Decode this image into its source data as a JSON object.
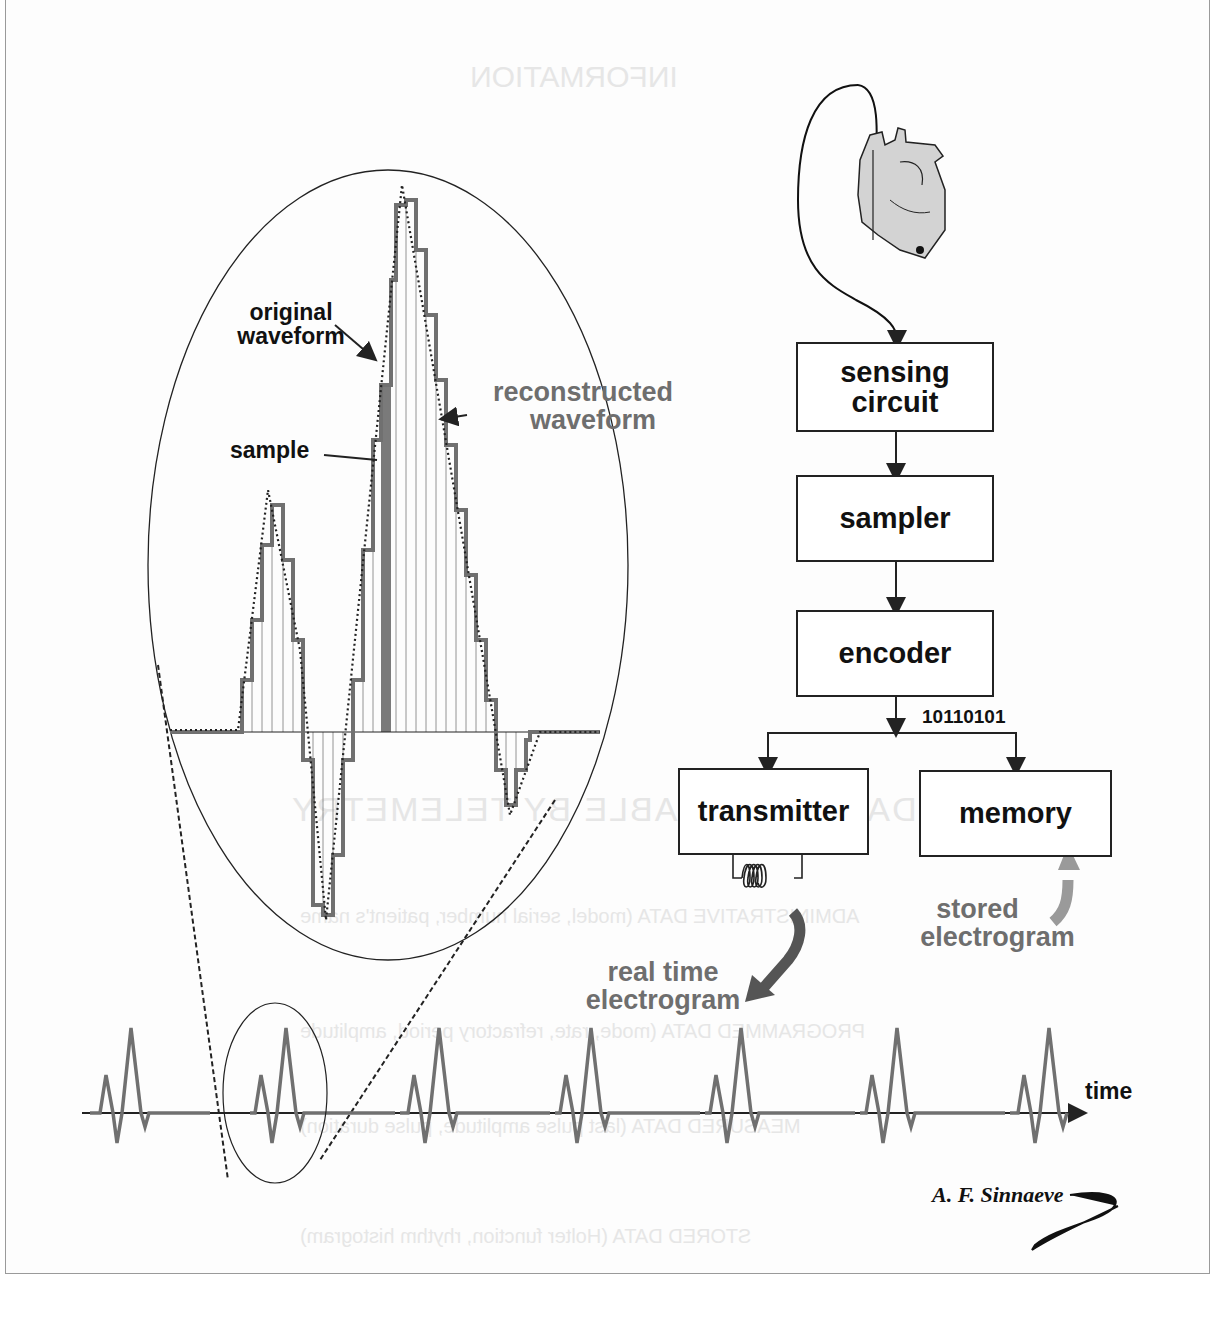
{
  "figure": {
    "author_signature": "A. F. Sinnaeve"
  },
  "zoom_view": {
    "labels": {
      "original_waveform": [
        "original",
        "waveform"
      ],
      "reconstructed_waveform": [
        "reconstructed",
        "waveform"
      ],
      "sample": "sample"
    }
  },
  "block_diagram": {
    "blocks": [
      {
        "id": "sensing",
        "label": "sensing circuit"
      },
      {
        "id": "sampler",
        "label": "sampler"
      },
      {
        "id": "encoder",
        "label": "encoder"
      },
      {
        "id": "transmitter",
        "label": "transmitter"
      },
      {
        "id": "memory",
        "label": "memory"
      }
    ],
    "binary_code": "10110101",
    "outputs": {
      "real_time": [
        "real time",
        "electrogram"
      ],
      "stored": [
        "stored",
        "electrogram"
      ]
    }
  },
  "timeline": {
    "axis_label": "time",
    "beat_count": 7
  },
  "colors": {
    "line": "#222222",
    "waveform_grey": "#707070",
    "heart_fill": "#d3d3d3",
    "arrow_dark": "#555555",
    "arrow_light": "#9a9a9a"
  }
}
